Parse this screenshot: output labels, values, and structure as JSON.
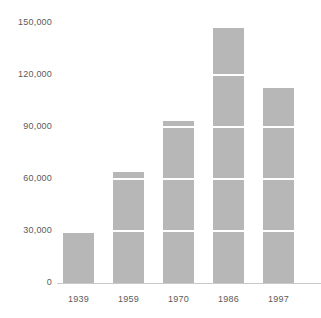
{
  "chart_data": {
    "type": "bar",
    "title": "",
    "subtitle": "",
    "xlabel": "",
    "ylabel": "",
    "categories": [
      "1939",
      "1959",
      "1970",
      "1986",
      "1997"
    ],
    "values": [
      29000,
      64000,
      93500,
      147000,
      112500
    ],
    "series": [
      {
        "name": "",
        "values": [
          29000,
          64000,
          93500,
          147000,
          112500
        ]
      }
    ],
    "ylim": [
      0,
      150000
    ],
    "yticks": [
      0,
      30000,
      60000,
      90000,
      120000,
      150000
    ],
    "ytick_labels": [
      "0",
      "30,000",
      "60,000",
      "90,000",
      "120,000",
      "150,000"
    ],
    "xtick_labels": [
      "1939",
      "1959",
      "1970",
      "1986",
      "1997"
    ],
    "grid": true,
    "grid_orientation": "horizontal",
    "grid_color": "#ffffff",
    "legend": false,
    "legend_position": "none",
    "bar_color": "#b7b7b7",
    "background_color": "#ffffff",
    "axis_color": "#c9c9c9",
    "text_color": "#5b5b5b",
    "annotations": []
  }
}
